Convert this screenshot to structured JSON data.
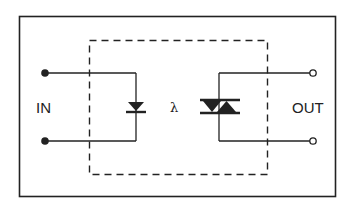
{
  "diagram": {
    "type": "optocoupler-circuit",
    "labels": {
      "input": "IN",
      "output": "OUT",
      "light": "λ"
    },
    "components": [
      {
        "name": "LED",
        "symbol": "diode",
        "side": "input"
      },
      {
        "name": "Triac",
        "symbol": "triac",
        "side": "output"
      }
    ],
    "terminals": {
      "input": [
        "filled-dot",
        "filled-dot"
      ],
      "output": [
        "open-circle",
        "open-circle"
      ]
    },
    "colors": {
      "stroke": "#222222",
      "background": "#ffffff"
    }
  }
}
